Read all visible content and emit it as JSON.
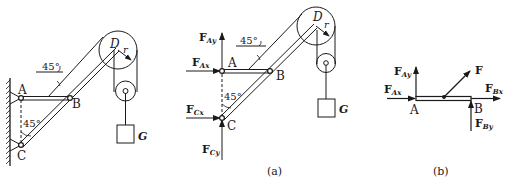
{
  "figures": {
    "original": {
      "points": {
        "A": "A",
        "B": "B",
        "C": "C",
        "D": "D"
      },
      "radius_label": "r",
      "weight_label": "G",
      "angle_top": "45°",
      "angle_bottom": "45°"
    },
    "a": {
      "caption": "(a)",
      "points": {
        "A": "A",
        "B": "B",
        "C": "C",
        "D": "D"
      },
      "radius_label": "r",
      "weight_label": "G",
      "angle_top": "45°",
      "angle_bottom": "45°",
      "forces": {
        "FAy": {
          "main": "F",
          "sub": "Ay"
        },
        "FAx": {
          "main": "F",
          "sub": "Ax"
        },
        "FCx": {
          "main": "F",
          "sub": "Cx"
        },
        "FCy": {
          "main": "F",
          "sub": "Cy"
        }
      }
    },
    "b": {
      "caption": "(b)",
      "points": {
        "A": "A",
        "B": "B"
      },
      "forces": {
        "FAy": {
          "main": "F",
          "sub": "Ay"
        },
        "FAx": {
          "main": "F",
          "sub": "Ax"
        },
        "F": {
          "main": "F"
        },
        "FBx": {
          "main": "F",
          "sub": "Bx"
        },
        "FBy": {
          "main": "F",
          "sub": "By"
        }
      }
    }
  },
  "colors": {
    "ink": "#1a1a1a",
    "background": "#ffffff"
  }
}
